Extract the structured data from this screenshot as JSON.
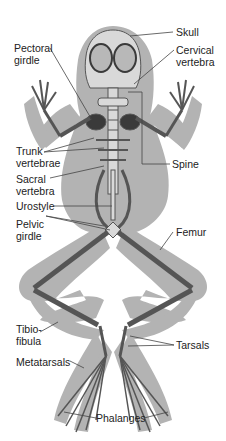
{
  "diagram": {
    "colors": {
      "body_silhouette": "#b3b3b3",
      "bone_fill": "#d9d9d9",
      "bone_outline": "#555555",
      "dark_bone": "#3a3a3a",
      "leader_line": "#444444",
      "label_text": "#222222",
      "background": "#ffffff"
    },
    "labels": {
      "skull": "Skull",
      "pectoral_girdle": "Pectoral\ngirdle",
      "cervical_vertebra": "Cervical\nvertebra",
      "trunk_vertebrae": "Trunk\nvertebrae",
      "spine": "Spine",
      "sacral_vertebra": "Sacral\nvertebra",
      "urostyle": "Urostyle",
      "pelvic_girdle": "Pelvic\ngirdle",
      "femur": "Femur",
      "tibio_fibula": "Tibio-\nfibula",
      "tarsals": "Tarsals",
      "metatarsals": "Metatarsals",
      "phalanges": "Phalanges"
    }
  }
}
